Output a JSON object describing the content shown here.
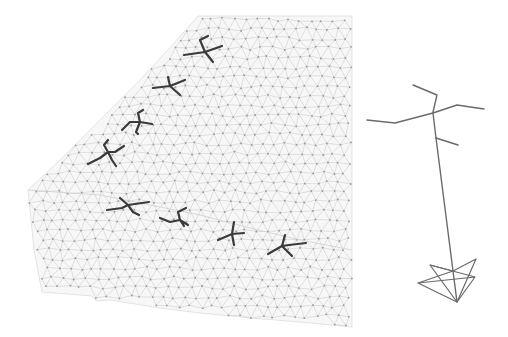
{
  "scene": {
    "description": "Triangulated 3D surface mesh with skeleton pose markers and a reference skeleton with camera frustum",
    "background_color": "#ffffff",
    "mesh": {
      "name": "terrain-block-mesh",
      "edge_color": "#c4c4c4",
      "node_color": "#9a9a9a"
    },
    "pose_markers": {
      "count": 8,
      "color": "#3a3a3a",
      "rows": [
        {
          "name": "diagonal-row",
          "count": 4
        },
        {
          "name": "front-row",
          "count": 4
        }
      ]
    },
    "reference_actor": {
      "name": "skeleton-with-camera",
      "color": "#6a6a6a",
      "parts": [
        "head-branch",
        "left-arm",
        "right-arm",
        "torso",
        "lower-branch",
        "view-ray",
        "camera-frustum"
      ]
    }
  }
}
